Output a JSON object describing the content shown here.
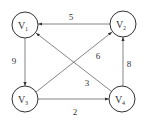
{
  "diagram": {
    "type": "directed-weighted-graph",
    "nodes": [
      {
        "id": "V1",
        "label": "V",
        "sub": "1",
        "x": 25,
        "y": 25
      },
      {
        "id": "V2",
        "label": "V",
        "sub": "2",
        "x": 123,
        "y": 24
      },
      {
        "id": "V3",
        "label": "V",
        "sub": "3",
        "x": 25,
        "y": 99
      },
      {
        "id": "V4",
        "label": "V",
        "sub": "4",
        "x": 122,
        "y": 99
      }
    ],
    "edges": [
      {
        "from": "V2",
        "to": "V1",
        "weight": "5"
      },
      {
        "from": "V1",
        "to": "V3",
        "weight": "9"
      },
      {
        "from": "V3",
        "to": "V2",
        "weight": "6"
      },
      {
        "from": "V4",
        "to": "V1",
        "weight": "3"
      },
      {
        "from": "V3",
        "to": "V4",
        "weight": "2"
      },
      {
        "from": "V4",
        "to": "V2",
        "weight": "8"
      }
    ]
  }
}
